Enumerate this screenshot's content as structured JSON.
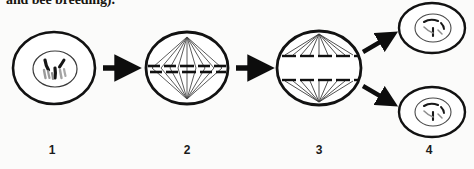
{
  "figure": {
    "kind": "biology-diagram",
    "caption_clipped_text": "and bee breeding).",
    "background_color": "#fbfbfa",
    "ink_color": "#121212",
    "arrow_color": "#0d0d0d"
  },
  "stages": [
    {
      "number": "1",
      "name": "interphase-prophase-cell",
      "description": "Cell with outer membrane and inner nucleus containing condensed chromosomes",
      "label": "1",
      "center_x": 54,
      "center_y": 68
    },
    {
      "number": "2",
      "name": "metaphase-cell",
      "description": "Cell with spindle fibres from two poles and chromosomes aligned on the equator",
      "label": "2",
      "center_x": 187,
      "center_y": 68
    },
    {
      "number": "3",
      "name": "anaphase-cell",
      "description": "Cell with chromosomes separated into two groups moving toward opposite poles",
      "label": "3",
      "center_x": 319,
      "center_y": 68
    },
    {
      "number": "4",
      "name": "telophase-daughter-cells",
      "description": "Two daughter cells, each with membrane and reformed nucleus",
      "label": "4",
      "center_x": 429,
      "center_y": 68
    }
  ],
  "arrows": [
    {
      "name": "arrow-stage1-to-stage2",
      "direction": "right"
    },
    {
      "name": "arrow-stage2-to-stage3",
      "direction": "right"
    },
    {
      "name": "arrow-stage3-to-upper-daughter",
      "direction": "up-right"
    },
    {
      "name": "arrow-stage3-to-lower-daughter",
      "direction": "down-right"
    }
  ]
}
